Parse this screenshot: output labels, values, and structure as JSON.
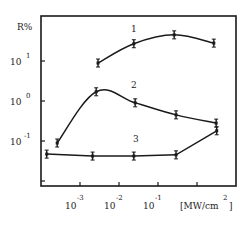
{
  "chart_data": {
    "type": "line",
    "title": "",
    "xlabel": "[MW/cm²]",
    "ylabel": "R%",
    "x_scale": "log",
    "y_scale": "log",
    "xlim": [
      0.0001,
      5
    ],
    "ylim": [
      0.01,
      200
    ],
    "grid": false,
    "legend": "inline curve labels 1, 2, 3",
    "x_ticks": [
      {
        "exp": "-3",
        "value": 0.001
      },
      {
        "exp": "-2",
        "value": 0.01
      },
      {
        "exp": "-1",
        "value": 0.1
      },
      {
        "exp": "",
        "value": 1
      }
    ],
    "y_ticks": [
      {
        "exp": "1",
        "value": 10
      },
      {
        "exp": "0",
        "value": 1
      },
      {
        "exp": "-1",
        "value": 0.1
      },
      {
        "exp": "",
        "value": 0.01
      }
    ],
    "series": [
      {
        "name": "1",
        "x": [
          0.0029,
          0.024,
          0.26,
          2.7
        ],
        "y": [
          8.9,
          27,
          45,
          28
        ]
      },
      {
        "name": "2",
        "x": [
          0.00026,
          0.0026,
          0.026,
          0.29,
          3.1
        ],
        "y": [
          0.089,
          1.7,
          0.9,
          0.45,
          0.28
        ]
      },
      {
        "name": "3",
        "x": [
          0.00014,
          0.0021,
          0.024,
          0.29,
          3.2
        ],
        "y": [
          0.047,
          0.042,
          0.042,
          0.045,
          0.18
        ]
      }
    ]
  },
  "labels": {
    "y_axis": "R%",
    "x_unit_open": "[MW/cm",
    "x_unit_sup": "2",
    "x_unit_close": "]",
    "base": "10",
    "curve1": "1",
    "curve2": "2",
    "curve3": "3"
  }
}
